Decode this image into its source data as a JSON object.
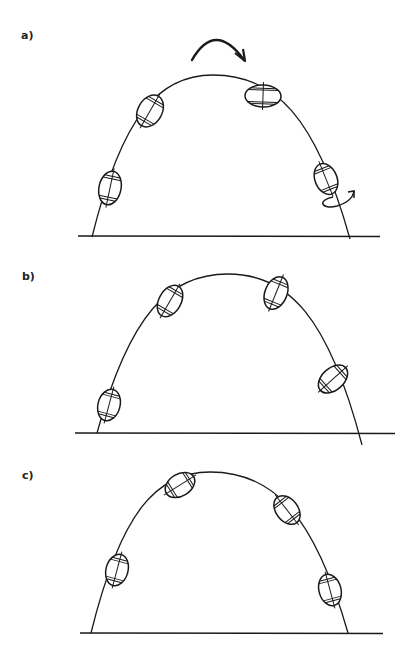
{
  "figure": {
    "panels": [
      {
        "id": "a",
        "label": "a)",
        "label_pos": [
          21,
          29
        ],
        "ground": {
          "x1": 78,
          "x2": 380,
          "y": 236
        },
        "trajectory": {
          "start": [
            92,
            237
          ],
          "apex": [
            213,
            75
          ],
          "end": [
            350,
            239
          ]
        },
        "rotation_arrow": {
          "start": [
            192,
            60
          ],
          "control": [
            215,
            20
          ],
          "end": [
            244,
            60
          ]
        },
        "balls": [
          {
            "cx": 110,
            "cy": 188,
            "rx": 11,
            "ry": 17,
            "tilt": 12
          },
          {
            "cx": 150,
            "cy": 111,
            "rx": 12,
            "ry": 17,
            "tilt": 30
          },
          {
            "cx": 263,
            "cy": 96,
            "rx": 18,
            "ry": 11,
            "tilt": 2
          },
          {
            "cx": 326,
            "cy": 179,
            "rx": 11,
            "ry": 16,
            "tilt": -22
          }
        ],
        "spin_arrow": {
          "cx": 335,
          "cy": 202
        }
      },
      {
        "id": "b",
        "label": "b)",
        "label_pos": [
          22,
          270
        ],
        "ground": {
          "x1": 75,
          "x2": 395,
          "y": 433
        },
        "trajectory": {
          "start": [
            97,
            433
          ],
          "apex": [
            228,
            274
          ],
          "end": [
            362,
            445
          ]
        },
        "balls": [
          {
            "cx": 109,
            "cy": 405,
            "rx": 11,
            "ry": 16,
            "tilt": 15
          },
          {
            "cx": 170,
            "cy": 301,
            "rx": 11,
            "ry": 17,
            "tilt": 30
          },
          {
            "cx": 276,
            "cy": 293,
            "rx": 11,
            "ry": 17,
            "tilt": 22
          },
          {
            "cx": 333,
            "cy": 379,
            "rx": 11,
            "ry": 17,
            "tilt": 48
          }
        ]
      },
      {
        "id": "c",
        "label": "c)",
        "label_pos": [
          22,
          469
        ],
        "ground": {
          "x1": 80,
          "x2": 383,
          "y": 633
        },
        "trajectory": {
          "start": [
            91,
            633
          ],
          "apex": [
            210,
            472
          ],
          "end": [
            348,
            633
          ]
        },
        "balls": [
          {
            "cx": 117,
            "cy": 570,
            "rx": 11,
            "ry": 16,
            "tilt": 15
          },
          {
            "cx": 180,
            "cy": 485,
            "rx": 11,
            "ry": 16,
            "tilt": 58
          },
          {
            "cx": 287,
            "cy": 510,
            "rx": 11,
            "ry": 16,
            "tilt": -38
          },
          {
            "cx": 330,
            "cy": 590,
            "rx": 11,
            "ry": 16,
            "tilt": -15
          }
        ]
      }
    ]
  },
  "colors": {
    "ink": "#1a1a1a",
    "background": "#ffffff"
  }
}
